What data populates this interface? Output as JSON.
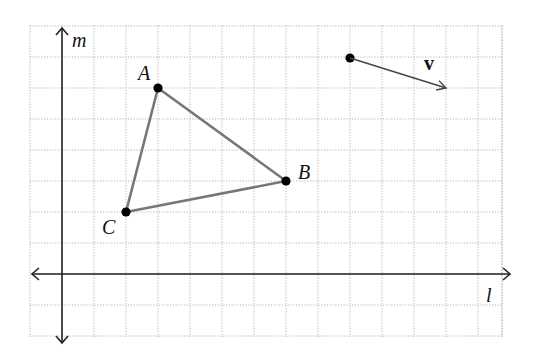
{
  "diagram": {
    "type": "coordinate-grid",
    "grid": {
      "x_min": -1,
      "x_max": 14,
      "y_min": -2,
      "y_max": 8,
      "origin_px": [
        62,
        274
      ],
      "cell_w": 32,
      "cell_h": 31,
      "line_color": "#b5b5b5"
    },
    "axes": {
      "horizontal_label": "l",
      "vertical_label": "m",
      "color": "#222222"
    },
    "triangle": {
      "stroke_color": "#777777",
      "vertices": [
        {
          "name": "A",
          "x": 3,
          "y": 6
        },
        {
          "name": "B",
          "x": 7,
          "y": 3
        },
        {
          "name": "C",
          "x": 2,
          "y": 2
        }
      ]
    },
    "vector": {
      "label": "v",
      "start": {
        "x": 9,
        "y": 7
      },
      "end": {
        "x": 12,
        "y": 6
      },
      "color": "#444444"
    }
  }
}
